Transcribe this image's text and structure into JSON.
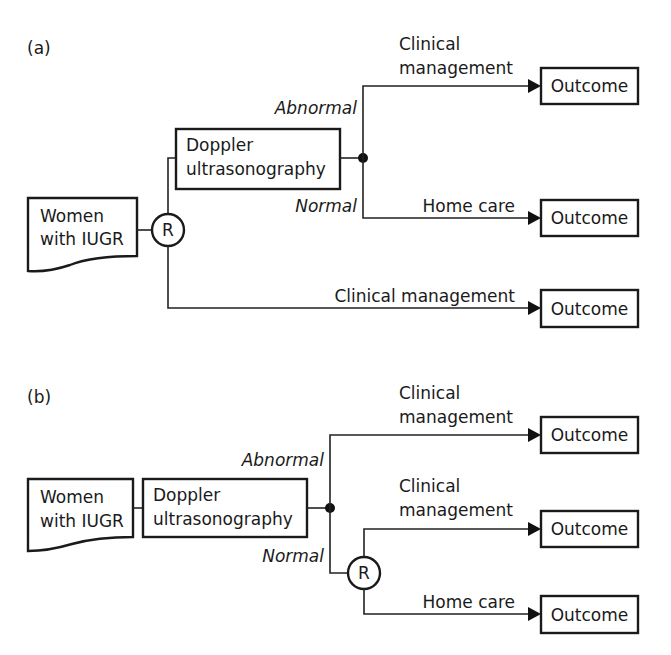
{
  "panels": [
    {
      "id": "a",
      "label": "(a)",
      "population": {
        "line1": "Women",
        "line2": "with IUGR"
      },
      "randomization": "R",
      "test": {
        "line1": "Doppler",
        "line2": "ultrasonography"
      },
      "result_labels": {
        "abnormal": "Abnormal",
        "normal": "Normal"
      },
      "branches": [
        {
          "path": "Doppler → Abnormal",
          "label_line1": "Clinical",
          "label_line2": "management",
          "outcome": "Outcome"
        },
        {
          "path": "Doppler → Normal",
          "label_line1": "Home care",
          "outcome": "Outcome"
        },
        {
          "path": "No Doppler",
          "label_line1": "Clinical management",
          "outcome": "Outcome"
        }
      ]
    },
    {
      "id": "b",
      "label": "(b)",
      "population": {
        "line1": "Women",
        "line2": "with IUGR"
      },
      "test": {
        "line1": "Doppler",
        "line2": "ultrasonography"
      },
      "result_labels": {
        "abnormal": "Abnormal",
        "normal": "Normal"
      },
      "randomization": "R",
      "branches": [
        {
          "path": "Abnormal",
          "label_line1": "Clinical",
          "label_line2": "management",
          "outcome": "Outcome"
        },
        {
          "path": "Normal → R arm 1",
          "label_line1": "Clinical",
          "label_line2": "management",
          "outcome": "Outcome"
        },
        {
          "path": "Normal → R arm 2",
          "label_line1": "Home care",
          "outcome": "Outcome"
        }
      ]
    }
  ],
  "colors": {
    "stroke": "#1a1a1a",
    "background": "#ffffff"
  }
}
